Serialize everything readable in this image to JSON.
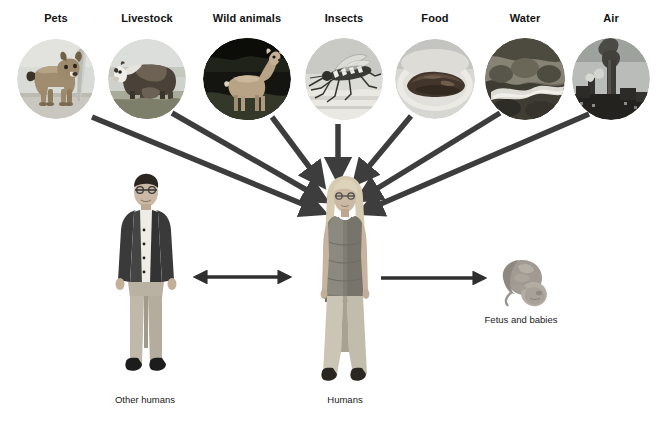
{
  "diagram": {
    "background": "#ffffff",
    "arrow_color": "#3d3d3d",
    "label_color": "#111111",
    "sources": [
      {
        "id": "pets",
        "label": "Pets",
        "label_x": 56,
        "label_y": 14,
        "cx": 56,
        "cy": 79,
        "rx": 39,
        "ry": 40,
        "art": "dog"
      },
      {
        "id": "livestock",
        "label": "Livestock",
        "label_x": 147,
        "label_y": 14,
        "cx": 147,
        "cy": 79,
        "rx": 39,
        "ry": 40,
        "art": "cow"
      },
      {
        "id": "wild-animals",
        "label": "Wild animals",
        "label_x": 247,
        "label_y": 14,
        "cx": 247,
        "cy": 79,
        "rx": 44,
        "ry": 41,
        "art": "deer"
      },
      {
        "id": "insects",
        "label": "Insects",
        "label_x": 344,
        "label_y": 14,
        "cx": 344,
        "cy": 79,
        "rx": 39,
        "ry": 41,
        "art": "mosquito"
      },
      {
        "id": "food",
        "label": "Food",
        "label_x": 435,
        "label_y": 14,
        "cx": 435,
        "cy": 79,
        "rx": 40,
        "ry": 40,
        "art": "meat"
      },
      {
        "id": "water",
        "label": "Water",
        "label_x": 525,
        "label_y": 14,
        "cx": 525,
        "cy": 79,
        "rx": 40,
        "ry": 41,
        "art": "stream"
      },
      {
        "id": "air",
        "label": "Air",
        "label_x": 611,
        "label_y": 14,
        "cx": 611,
        "cy": 79,
        "rx": 39,
        "ry": 41,
        "art": "smokestack"
      }
    ],
    "actors": [
      {
        "id": "other-humans",
        "label": "Other humans",
        "label_x": 145,
        "label_y": 401,
        "x": 108,
        "y": 172,
        "w": 76,
        "h": 218
      },
      {
        "id": "humans",
        "label": "Humans",
        "label_x": 345,
        "label_y": 401,
        "x": 305,
        "y": 176,
        "w": 80,
        "h": 220
      },
      {
        "id": "fetus-and-babies",
        "label": "Fetus and babies",
        "label_x": 521,
        "label_y": 321,
        "x": 490,
        "y": 252,
        "w": 62,
        "h": 62
      }
    ],
    "arrows": [
      {
        "id": "pets-to-humans",
        "from": "pets",
        "to": "humans",
        "x1": 92,
        "y1": 117,
        "x2": 325,
        "y2": 213,
        "head": "end"
      },
      {
        "id": "livestock-to-humans",
        "from": "livestock",
        "to": "humans",
        "x1": 172,
        "y1": 113,
        "x2": 327,
        "y2": 201,
        "head": "end"
      },
      {
        "id": "wild-animals-to-humans",
        "from": "wild-animals",
        "to": "humans",
        "x1": 272,
        "y1": 117,
        "x2": 325,
        "y2": 186,
        "head": "end"
      },
      {
        "id": "insects-to-humans",
        "from": "insects",
        "to": "humans",
        "x1": 338,
        "y1": 124,
        "x2": 338,
        "y2": 182,
        "head": "end"
      },
      {
        "id": "food-to-humans",
        "from": "food",
        "to": "humans",
        "x1": 411,
        "y1": 116,
        "x2": 354,
        "y2": 184,
        "head": "end"
      },
      {
        "id": "water-to-humans",
        "from": "water",
        "to": "humans",
        "x1": 500,
        "y1": 113,
        "x2": 358,
        "y2": 200,
        "head": "end"
      },
      {
        "id": "air-to-humans",
        "from": "air",
        "to": "humans",
        "x1": 589,
        "y1": 114,
        "x2": 360,
        "y2": 213,
        "head": "end"
      },
      {
        "id": "humans-other-humans",
        "from": "humans",
        "to": "other-humans",
        "x1": 193,
        "y1": 277,
        "x2": 292,
        "y2": 277,
        "head": "both"
      },
      {
        "id": "humans-to-fetus",
        "from": "humans",
        "to": "fetus-and-babies",
        "x1": 382,
        "y1": 278,
        "x2": 487,
        "y2": 278,
        "head": "end"
      }
    ]
  }
}
